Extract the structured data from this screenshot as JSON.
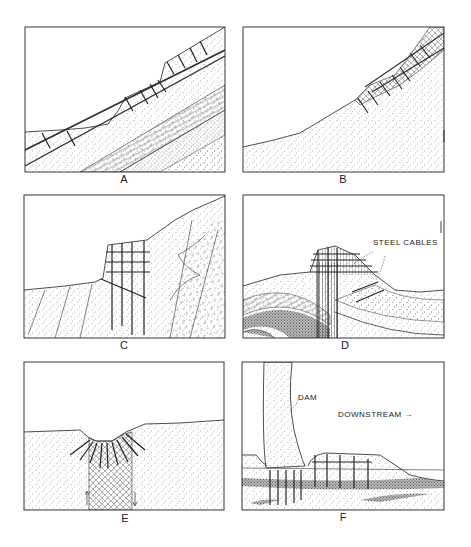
{
  "figure": {
    "panels": [
      {
        "id": "A",
        "label": "A",
        "content": "Bedded slope with two bolted benches; stippled and brick-patterned strata dipping up-slope"
      },
      {
        "id": "B",
        "label": "B",
        "content": "Smooth concave slope with bolted cross-hatched zone near the crest"
      },
      {
        "id": "C",
        "label": "C",
        "content": "Steep rock face bolted by a grid of bolts; folded strata on right"
      },
      {
        "id": "D",
        "label": "D",
        "content": "Anticlinal knob stabilized by steel cables over a shattered vertical zone",
        "annotations": [
          "STEEL CABLES"
        ]
      },
      {
        "id": "E",
        "label": "E",
        "content": "Valley floor with radiating bolts over a cross-hatched fault/shear zone between arrows"
      },
      {
        "id": "F",
        "label": "F",
        "content": "Dam foundation with vertical anchors and a bolted downstream apron",
        "annotations": [
          "DAM",
          "DOWNSTREAM →"
        ]
      }
    ]
  },
  "annotations": {
    "steel_cables": "STEEL CABLES",
    "dam": "DAM",
    "downstream": "DOWNSTREAM →"
  },
  "colors": {
    "ink": "#222222",
    "background": "#ffffff",
    "stipple": "#555555"
  }
}
